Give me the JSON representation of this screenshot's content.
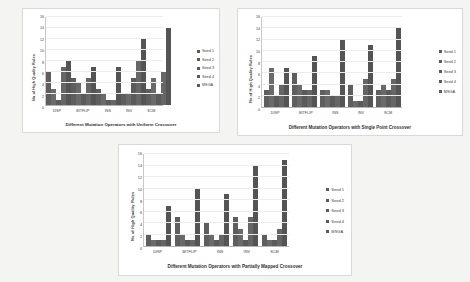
{
  "charts": [
    {
      "id": "uniform",
      "chart_data": {
        "type": "bar",
        "title": "",
        "xlabel": "Different Mutation Operators  with Uniform Crossover",
        "ylabel": "No of High Quality Rules",
        "ylim": [
          0,
          16
        ],
        "yticks": [
          0,
          2,
          4,
          6,
          8,
          10,
          12,
          14,
          16
        ],
        "grid": true,
        "legend_position": "right",
        "categories": [
          "DISP",
          "BITFLIP",
          "INS",
          "INV",
          "SCM"
        ],
        "series": [
          {
            "name": "Seed 1",
            "values": [
              6,
              5,
              3,
              2,
              3
            ]
          },
          {
            "name": "Seed 2",
            "values": [
              3,
              4,
              2,
              2,
              5
            ]
          },
          {
            "name": "Seed 3",
            "values": [
              1,
              2,
              1,
              5,
              2
            ]
          },
          {
            "name": "Seed 4",
            "values": [
              7,
              5,
              1,
              8,
              6
            ]
          },
          {
            "name": "MSGA",
            "values": [
              8,
              7,
              7,
              12,
              14
            ]
          }
        ]
      }
    },
    {
      "id": "single",
      "chart_data": {
        "type": "bar",
        "title": "",
        "xlabel": "Different Mutation Operators  with Single Point Crossover",
        "ylabel": "No of High Quality Rules",
        "ylim": [
          0,
          16
        ],
        "yticks": [
          0,
          2,
          4,
          6,
          8,
          10,
          12,
          14,
          16
        ],
        "grid": true,
        "legend_position": "right",
        "categories": [
          "DISP",
          "BITFLIP",
          "INS",
          "INV",
          "SCM"
        ],
        "series": [
          {
            "name": "Seed 1",
            "values": [
              3,
              6,
              3,
              4,
              3
            ]
          },
          {
            "name": "Seed 2",
            "values": [
              7,
              4,
              3,
              1,
              4
            ]
          },
          {
            "name": "Seed 3",
            "values": [
              2,
              3,
              2,
              1,
              3
            ]
          },
          {
            "name": "Seed 4",
            "values": [
              4,
              3,
              2,
              5,
              5
            ]
          },
          {
            "name": "MSGA",
            "values": [
              7,
              9,
              12,
              11,
              14
            ]
          }
        ]
      }
    },
    {
      "id": "pmx",
      "chart_data": {
        "type": "bar",
        "title": "",
        "xlabel": "Different Mutation Operators with Partially Mapped Crossover",
        "ylabel": "No of High Quality Rules",
        "ylim": [
          0,
          16
        ],
        "yticks": [
          0,
          2,
          4,
          6,
          8,
          10,
          12,
          14,
          16
        ],
        "grid": true,
        "legend_position": "right",
        "categories": [
          "DISP",
          "BITFLIP",
          "INS",
          "INV",
          "SCM"
        ],
        "series": [
          {
            "name": "Seed 1",
            "values": [
              2,
              5,
              4,
              5,
              2
            ]
          },
          {
            "name": "Seed 2",
            "values": [
              1,
              2,
              2,
              3,
              1
            ]
          },
          {
            "name": "Seed 3",
            "values": [
              1,
              1,
              1,
              1,
              1
            ]
          },
          {
            "name": "Seed 4",
            "values": [
              1,
              1,
              2,
              5,
              3
            ]
          },
          {
            "name": "MSGA",
            "values": [
              7,
              10,
              9,
              14,
              15
            ]
          }
        ]
      }
    }
  ],
  "colors": {
    "bar": "#5b5b5b",
    "panel_background": "#ffffff",
    "page_background": "#f4f4f2",
    "axis": "#b4b4b4",
    "grid": "#ececec",
    "text": "#3b3b3b"
  }
}
